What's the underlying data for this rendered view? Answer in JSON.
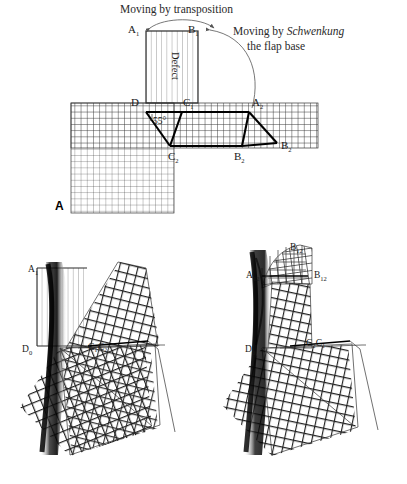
{
  "figure": {
    "panel_a_letter": "A",
    "annotations": {
      "transposition": "Moving by transposition",
      "schwenkung_line1_pre": "Moving by ",
      "schwenkung_word": "Schwenkung",
      "schwenkung_line2": "the flap base"
    },
    "defect_label": "Defect",
    "angle_label": "55°",
    "labels_top": {
      "a1": "A",
      "a1_sub": "1",
      "b1": "B",
      "b1_sub": "1",
      "d": "D",
      "c1": "C",
      "c1_sub": "1",
      "a2": "A",
      "a2_sub": "2",
      "c2": "C",
      "c2_sub": "2",
      "b2": "B",
      "b2_sub": "2",
      "b2r": "B",
      "b2r_sub": "2"
    },
    "labels_bottom_left": {
      "a1": "A",
      "a1_sub": "1",
      "d0": "D",
      "d0_sub": "0",
      "c1c2": "C₁C₂"
    },
    "labels_bottom_right": {
      "b12_top": "B",
      "b12_top_sub": "12",
      "a12": "A",
      "a12_sub": "12",
      "b12": "B",
      "b12_sub": "12",
      "d0": "D",
      "d0_sub": "0",
      "c2c1": "C₂C₁"
    },
    "colors": {
      "ink": "#1a1a1a",
      "grid": "#3a3a3a",
      "heavy": "#000000",
      "annotation": "#555555",
      "background": "#ffffff"
    }
  }
}
